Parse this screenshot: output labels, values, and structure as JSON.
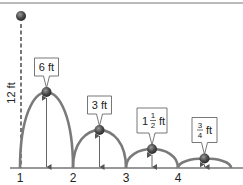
{
  "colors": {
    "arc": "#7a7a7a",
    "ball": "#4a4a4a",
    "ground": "#333333",
    "dashed": "#777777",
    "arrow": "#555555",
    "label_border": "#555555"
  },
  "initial_drop": {
    "height_label": "12 ft",
    "height_ft": 12
  },
  "ground_ticks": [
    "1",
    "2",
    "3",
    "4"
  ],
  "bounces": [
    {
      "label_whole": "6 ft",
      "label_int": "",
      "label_num": "",
      "label_den": "",
      "label_unit": "",
      "height_ft": 6
    },
    {
      "label_whole": "3 ft",
      "label_int": "",
      "label_num": "",
      "label_den": "",
      "label_unit": "",
      "height_ft": 3
    },
    {
      "label_whole": "",
      "label_int": "1",
      "label_num": "1",
      "label_den": "2",
      "label_unit": "ft",
      "height_ft": 1.5
    },
    {
      "label_whole": "",
      "label_int": "",
      "label_num": "3",
      "label_den": "4",
      "label_unit": "ft",
      "height_ft": 0.75
    }
  ]
}
